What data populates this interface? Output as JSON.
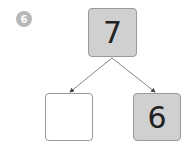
{
  "question_number": "6",
  "diagram": {
    "whole": "7",
    "part_left": "",
    "part_right": "6"
  },
  "colors": {
    "filled_box": "#d0d0d0",
    "badge": "#b8b8b8",
    "arrow": "#555555"
  }
}
